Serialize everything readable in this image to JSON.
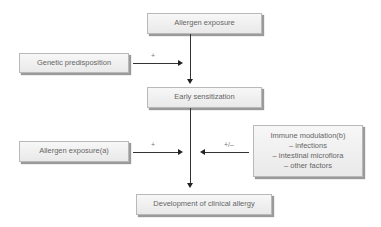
{
  "diagram": {
    "nodes": {
      "allergen_exposure": "Allergen exposure",
      "genetic_predisposition": "Genetic predisposition",
      "early_sensitization": "Early sensitization",
      "allergen_exposure_a": "Allergen exposure(a)",
      "immune_modulation": {
        "title": "Immune modulation(b)",
        "items": [
          "– infections",
          "– intestinal microflora",
          "– other factors"
        ]
      },
      "clinical_allergy": "Development of clinical allergy"
    },
    "edges": {
      "genetic_sign": "+",
      "allergen_a_sign": "+",
      "immune_sign": "+/–"
    }
  }
}
